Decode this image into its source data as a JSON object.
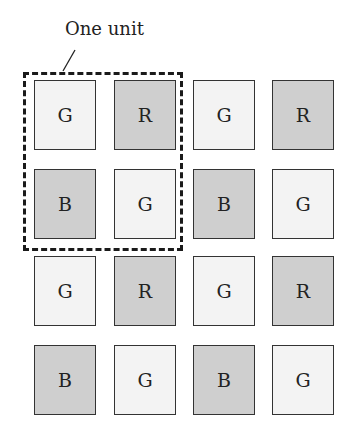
{
  "annotation": {
    "label": "One unit"
  },
  "grid": {
    "rows": [
      [
        "G",
        "R",
        "G",
        "R"
      ],
      [
        "B",
        "G",
        "B",
        "G"
      ],
      [
        "G",
        "R",
        "G",
        "R"
      ],
      [
        "B",
        "G",
        "B",
        "G"
      ]
    ]
  },
  "colors": {
    "green_cell": "#f3f3f3",
    "red_blue_cell": "#cfcfcf",
    "border": "#333333"
  }
}
